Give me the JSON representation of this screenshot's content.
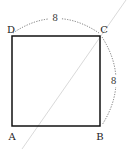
{
  "diagram": {
    "shape": "square",
    "vertices": [
      {
        "label": "A",
        "x": 12,
        "y": 126
      },
      {
        "label": "B",
        "x": 100,
        "y": 126
      },
      {
        "label": "C",
        "x": 100,
        "y": 36
      },
      {
        "label": "D",
        "x": 12,
        "y": 36
      }
    ],
    "dimensions": [
      {
        "side": "DC",
        "label": "8"
      },
      {
        "side": "CB",
        "label": "8"
      }
    ],
    "diagonal_line": {
      "description": "thin gray line through point C",
      "color": "#c8c8c8"
    },
    "colors": {
      "square": "#111111",
      "arc": "#555555",
      "line": "#c8c8c8"
    }
  }
}
